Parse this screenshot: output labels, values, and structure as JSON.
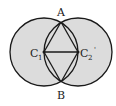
{
  "diagram": {
    "points": {
      "A": {
        "label": "A"
      },
      "B": {
        "label": "B"
      },
      "C1": {
        "label": "C",
        "subscript": "1"
      },
      "C2": {
        "label": "C",
        "subscript": "2",
        "mark": "'"
      }
    },
    "colors": {
      "fill": "#dcdcdc",
      "stroke": "#1a1a1a",
      "background": "#ffffff"
    }
  }
}
